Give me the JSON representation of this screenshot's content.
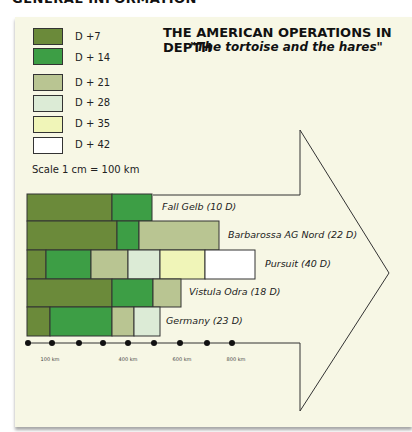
{
  "header": {
    "section": "GENERAL INFORMATION"
  },
  "colors": {
    "D+7": "#6b8a3a",
    "D+14": "#3d9e45",
    "D+21": "#b9c592",
    "D+28": "#dcebd6",
    "D+35": "#f0f5b8",
    "D+42": "#ffffff",
    "background": "#f7f7e5",
    "outline": "#333333"
  },
  "legend": {
    "items": [
      {
        "label": "D +7",
        "key": "D+7"
      },
      {
        "label": "D + 14",
        "key": "D+14"
      },
      {
        "label": "D + 21",
        "key": "D+21"
      },
      {
        "label": "D + 28",
        "key": "D+28"
      },
      {
        "label": "D + 35",
        "key": "D+35"
      },
      {
        "label": "D + 42",
        "key": "D+42"
      }
    ],
    "scale": "Scale 1 cm = 100 km"
  },
  "chart_data": {
    "type": "bar",
    "orientation": "horizontal-stacked",
    "title": "THE AMERICAN OPERATIONS IN DEPTH",
    "subtitle": "\"The tortoise and the hares\"",
    "xlabel": "Distance (km)",
    "x_ticks": [
      "100 km",
      "400 km",
      "600 km",
      "800 km"
    ],
    "scale_note": "Scale 1 cm = 100 km",
    "series_keys": [
      "D+7",
      "D+14",
      "D+21",
      "D+28",
      "D+35",
      "D+42"
    ],
    "categories": [
      "Fall Gelb (10 D)",
      "Barbarossa AG Nord (22 D)",
      "Pursuit (40 D)",
      "Vistula Odra (18 D)",
      "Germany (23 D)"
    ],
    "series": [
      {
        "name": "D +7",
        "values": [
          330,
          350,
          75,
          330,
          90
        ]
      },
      {
        "name": "D + 14",
        "values": [
          160,
          85,
          175,
          160,
          240
        ]
      },
      {
        "name": "D + 21",
        "values": [
          0,
          310,
          145,
          110,
          85
        ]
      },
      {
        "name": "D + 28",
        "values": [
          0,
          0,
          125,
          0,
          100
        ]
      },
      {
        "name": "D + 35",
        "values": [
          0,
          0,
          175,
          0,
          0
        ]
      },
      {
        "name": "D + 42",
        "values": [
          0,
          0,
          195,
          0,
          0
        ]
      }
    ],
    "cumulative_km_approx": [
      490,
      745,
      890,
      600,
      515
    ],
    "legend_position": "top-left"
  },
  "rows": [
    {
      "label": "Fall Gelb (10 D)",
      "segments": [
        [
          27,
          112,
          "D+7"
        ],
        [
          112,
          152,
          "D+14"
        ]
      ],
      "label_x": 162
    },
    {
      "label": "Barbarossa AG Nord (22 D)",
      "segments": [
        [
          27,
          117,
          "D+7"
        ],
        [
          117,
          139,
          "D+14"
        ],
        [
          139,
          219,
          "D+21"
        ]
      ],
      "label_x": 228
    },
    {
      "label": "Pursuit (40 D)",
      "segments": [
        [
          27,
          46,
          "D+7"
        ],
        [
          46,
          91,
          "D+14"
        ],
        [
          91,
          128,
          "D+21"
        ],
        [
          128,
          160,
          "D+28"
        ],
        [
          160,
          205,
          "D+35"
        ],
        [
          205,
          255,
          "D+42"
        ]
      ],
      "label_x": 265
    },
    {
      "label": "Vistula Odra (18 D)",
      "segments": [
        [
          27,
          112,
          "D+7"
        ],
        [
          112,
          153,
          "D+14"
        ],
        [
          153,
          181,
          "D+21"
        ]
      ],
      "label_x": 189
    },
    {
      "label": "Germany (23 D)",
      "segments": [
        [
          27,
          50,
          "D+7"
        ],
        [
          50,
          112,
          "D+14"
        ],
        [
          112,
          134,
          "D+21"
        ],
        [
          134,
          160,
          "D+28"
        ]
      ],
      "label_x": 166
    }
  ],
  "axis": {
    "labels": [
      {
        "text": "100 km",
        "x": 50
      },
      {
        "text": "400 km",
        "x": 128
      },
      {
        "text": "600 km",
        "x": 182
      },
      {
        "text": "800 km",
        "x": 236
      }
    ]
  }
}
